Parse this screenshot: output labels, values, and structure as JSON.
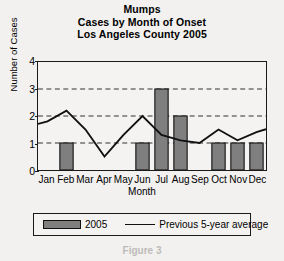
{
  "chart_data": {
    "type": "bar",
    "title": "Mumps",
    "title_lines": [
      "Mumps",
      "Cases by Month of Onset",
      "Los Angeles County 2005"
    ],
    "subtitle": "Cases by Month of Onset",
    "title_line3": "Los Angeles County 2005",
    "xlabel": "Month",
    "ylabel": "Number of Cases",
    "categories": [
      "Jan",
      "Feb",
      "Mar",
      "Apr",
      "May",
      "Jun",
      "Jul",
      "Aug",
      "Sep",
      "Oct",
      "Nov",
      "Dec"
    ],
    "ylim": [
      0,
      4
    ],
    "y_ticks": [
      0,
      1,
      2,
      3,
      4
    ],
    "y_tick_labels": [
      "0",
      "1",
      "2",
      "3",
      "4"
    ],
    "grid": "horizontal-dashed-at-1-2-3",
    "legend_position": "below-plot",
    "series": [
      {
        "name": "2005",
        "type": "bar",
        "color": "#7f7f7f",
        "values": [
          0,
          1,
          0,
          0,
          0,
          1,
          3,
          2,
          0,
          1,
          1,
          1
        ]
      },
      {
        "name": "Previous 5-year average",
        "type": "line",
        "color": "#111111",
        "values": [
          1.8,
          2.2,
          1.5,
          0.5,
          1.3,
          2.0,
          1.3,
          1.1,
          1.0,
          1.5,
          1.1,
          1.4
        ]
      }
    ]
  },
  "legend": {
    "bar_label": "2005",
    "line_label": "Previous 5-year average"
  },
  "artifact": {
    "bottom_text": "Figure 3"
  }
}
